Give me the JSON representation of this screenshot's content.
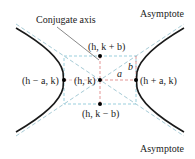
{
  "diagram": {
    "type": "hyperbola-horizontal-transverse-axis",
    "labels": {
      "conjugate_axis": "Conjugate axis",
      "asymptote_top": "Asymptote",
      "asymptote_bottom": "Asymptote",
      "a": "a",
      "b": "b"
    },
    "points": {
      "center": "(h, k)",
      "top": "(h, k + b)",
      "bottom": "(h, k − b)",
      "left_vertex": "(h − a, k)",
      "right_vertex": "(h + a, k)"
    },
    "colors": {
      "curve": "#1a1a1a",
      "asymptote": "#8fc9d9",
      "box": "#8fc9d9",
      "axes": "#e08080",
      "pointer": "#555555",
      "point": "#000000"
    }
  }
}
